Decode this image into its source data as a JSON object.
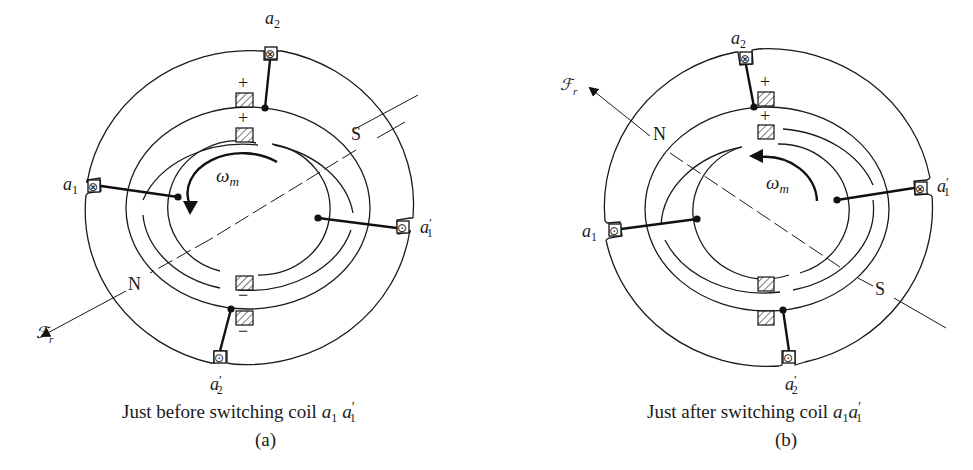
{
  "figure": {
    "panels": [
      {
        "id": "a",
        "caption": "Just before switching coil",
        "caption_coil": "a",
        "caption_coil_sub": "1",
        "caption_coil2": "a",
        "caption_coil2_sub": "1",
        "caption_coil2_prime": "′",
        "panel_label": "(a)",
        "coils": [
          {
            "name": "a",
            "sub": "2",
            "prime": "",
            "symbol": "⊗"
          },
          {
            "name": "a",
            "sub": "1",
            "prime": "",
            "symbol": "⊗"
          },
          {
            "name": "a",
            "sub": "1",
            "prime": "′",
            "symbol": "⊙"
          },
          {
            "name": "a",
            "sub": "2",
            "prime": "′",
            "symbol": "⊙"
          }
        ],
        "brush_signs": [
          "+",
          "+",
          "−",
          "−"
        ],
        "pole_labels": {
          "north": "N",
          "south": "S"
        },
        "mmf_label": "ℱ",
        "mmf_sub": "r",
        "speed_label": "ω",
        "speed_sub": "m"
      },
      {
        "id": "b",
        "caption": "Just after switching coil",
        "caption_coil": "a",
        "caption_coil_sub": "1",
        "caption_coil2": "a",
        "caption_coil2_sub": "1",
        "caption_coil2_prime": "′",
        "panel_label": "(b)",
        "coils": [
          {
            "name": "a",
            "sub": "2",
            "prime": "",
            "symbol": "⊗"
          },
          {
            "name": "a",
            "sub": "1",
            "prime": "",
            "symbol": "⊙"
          },
          {
            "name": "a",
            "sub": "1",
            "prime": "′",
            "symbol": "⊗"
          },
          {
            "name": "a",
            "sub": "2",
            "prime": "′",
            "symbol": "⊙"
          }
        ],
        "brush_signs": [
          "+",
          "+"
        ],
        "pole_labels": {
          "north": "N",
          "south": "S"
        },
        "mmf_label": "ℱ",
        "mmf_sub": "r",
        "speed_label": "ω",
        "speed_sub": "m"
      }
    ]
  }
}
